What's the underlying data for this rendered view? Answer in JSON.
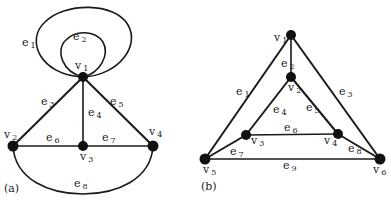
{
  "figure_a": {
    "caption": "(a)",
    "vertices": [
      {
        "id": "v1",
        "base": "v",
        "sub": "1"
      },
      {
        "id": "v2",
        "base": "v",
        "sub": "2"
      },
      {
        "id": "v3",
        "base": "v",
        "sub": "3"
      },
      {
        "id": "v4",
        "base": "v",
        "sub": "4"
      }
    ],
    "edges": [
      {
        "id": "e1",
        "base": "e",
        "sub": "1",
        "from": "v1",
        "to": "v1",
        "kind": "loop"
      },
      {
        "id": "e2",
        "base": "e",
        "sub": "2",
        "from": "v1",
        "to": "v1",
        "kind": "loop"
      },
      {
        "id": "e3",
        "base": "e",
        "sub": "3",
        "from": "v1",
        "to": "v2"
      },
      {
        "id": "e4",
        "base": "e",
        "sub": "4",
        "from": "v1",
        "to": "v3"
      },
      {
        "id": "e5",
        "base": "e",
        "sub": "5",
        "from": "v1",
        "to": "v4"
      },
      {
        "id": "e6",
        "base": "e",
        "sub": "6",
        "from": "v2",
        "to": "v3"
      },
      {
        "id": "e7",
        "base": "e",
        "sub": "7",
        "from": "v3",
        "to": "v4"
      },
      {
        "id": "e8",
        "base": "e",
        "sub": "8",
        "from": "v2",
        "to": "v4",
        "kind": "arc"
      }
    ]
  },
  "figure_b": {
    "caption": "(b)",
    "vertices": [
      {
        "id": "v1",
        "base": "v",
        "sub": "1"
      },
      {
        "id": "v2",
        "base": "v",
        "sub": "2"
      },
      {
        "id": "v3",
        "base": "v",
        "sub": "3"
      },
      {
        "id": "v4",
        "base": "v",
        "sub": "4"
      },
      {
        "id": "v5",
        "base": "v",
        "sub": "5"
      },
      {
        "id": "v6",
        "base": "v",
        "sub": "6"
      }
    ],
    "edges": [
      {
        "id": "e1",
        "base": "e",
        "sub": "1",
        "from": "v1",
        "to": "v5"
      },
      {
        "id": "e2",
        "base": "e",
        "sub": "2",
        "from": "v1",
        "to": "v2"
      },
      {
        "id": "e3",
        "base": "e",
        "sub": "3",
        "from": "v1",
        "to": "v6"
      },
      {
        "id": "e4",
        "base": "e",
        "sub": "4",
        "from": "v2",
        "to": "v3"
      },
      {
        "id": "e5",
        "base": "e",
        "sub": "5",
        "from": "v2",
        "to": "v4"
      },
      {
        "id": "e6",
        "base": "e",
        "sub": "6",
        "from": "v3",
        "to": "v4"
      },
      {
        "id": "e7",
        "base": "e",
        "sub": "7",
        "from": "v3",
        "to": "v5"
      },
      {
        "id": "e8",
        "base": "e",
        "sub": "8",
        "from": "v4",
        "to": "v6"
      },
      {
        "id": "e9",
        "base": "e",
        "sub": "9",
        "from": "v5",
        "to": "v6"
      }
    ]
  }
}
